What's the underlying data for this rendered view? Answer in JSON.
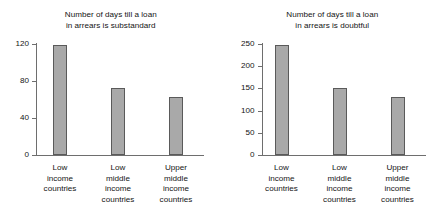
{
  "chart_data": [
    {
      "type": "bar",
      "title": "Number of days till a loan in arrears is substandard",
      "title_lines": [
        "Number of days till a loan",
        "in arrears is substandard"
      ],
      "xlabel": "",
      "ylabel": "",
      "categories": [
        "Low income countries",
        "Low middle income countries",
        "Upper middle income countries"
      ],
      "category_lines": [
        [
          "Low",
          "income",
          "countries"
        ],
        [
          "Low",
          "middle",
          "income",
          "countries"
        ],
        [
          "Upper",
          "middle",
          "income",
          "countries"
        ]
      ],
      "values": [
        119,
        72,
        63
      ],
      "ylim": [
        0,
        130
      ],
      "yticks": [
        0,
        40,
        80,
        120
      ],
      "ytick_labels": [
        "0",
        "40",
        "80",
        "120"
      ],
      "grid": false,
      "legend": "none",
      "bar_color": "#a9a9a9",
      "bar_edge_color": "#5a5a5a",
      "axis_color": "#6e6e6e"
    },
    {
      "type": "bar",
      "title": "Number of days till a loan in arrears is doubtful",
      "title_lines": [
        "Number of days till a loan",
        "in arrears is doubtful"
      ],
      "xlabel": "",
      "ylabel": "",
      "categories": [
        "Low income countries",
        "Low middle income countries",
        "Upper middle income countries"
      ],
      "category_lines": [
        [
          "Low",
          "income",
          "countries"
        ],
        [
          "Low",
          "middle",
          "income",
          "countries"
        ],
        [
          "Upper",
          "middle",
          "income",
          "countries"
        ]
      ],
      "values": [
        248,
        150,
        130
      ],
      "ylim": [
        0,
        265
      ],
      "yticks": [
        0,
        50,
        100,
        150,
        200,
        250
      ],
      "ytick_labels": [
        "0",
        "50",
        "100",
        "150",
        "200",
        "250"
      ],
      "grid": false,
      "legend": "none",
      "bar_color": "#a9a9a9",
      "bar_edge_color": "#5a5a5a",
      "axis_color": "#6e6e6e"
    }
  ]
}
